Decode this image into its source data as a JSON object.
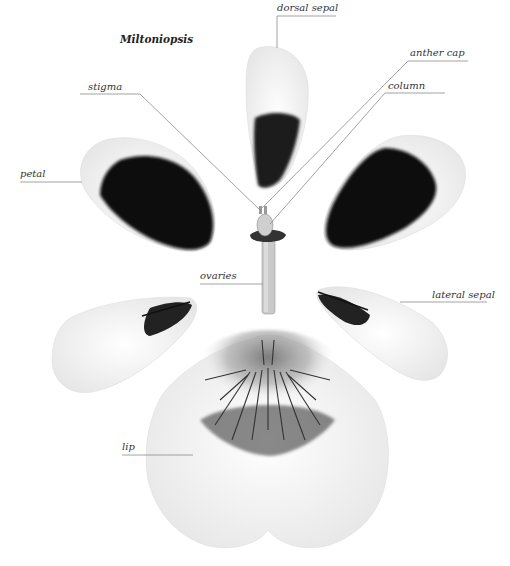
{
  "diagram": {
    "title": "Miltoniopsis",
    "labels": {
      "dorsal_sepal": "dorsal sepal",
      "anther_cap": "anther cap",
      "stigma": "stigma",
      "column": "column",
      "petal": "petal",
      "ovaries": "ovaries",
      "lateral_sepal": "lateral sepal",
      "lip": "lip"
    },
    "colors": {
      "background": "#ffffff",
      "leader_line": "#8a8a8a",
      "blotch": "#111111",
      "petal_base": "#f4f4f4",
      "lip_marking": "#555555"
    }
  }
}
